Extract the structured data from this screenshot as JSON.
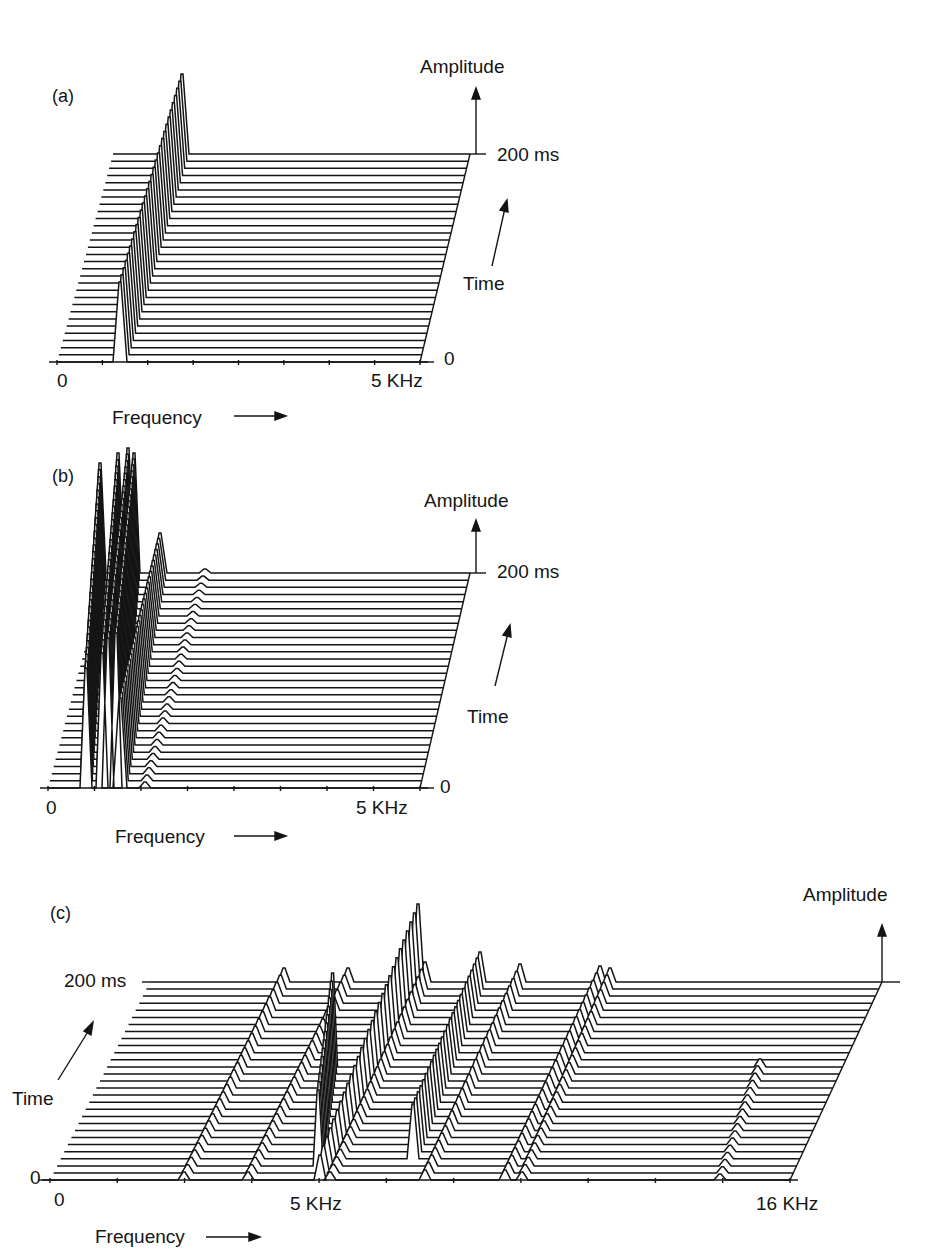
{
  "figure": {
    "background": "#ffffff",
    "ink": "#141414"
  },
  "chart_data": [
    {
      "panel": "(a)",
      "type": "waterfall",
      "title": "",
      "xlabel": "Frequency",
      "ylabel": "Amplitude",
      "zlabel": "Time",
      "x_ticks": [
        "0",
        "5 KHz"
      ],
      "xlim_khz": [
        0,
        5
      ],
      "time_ticks": [
        "0",
        "200 ms"
      ],
      "num_slices": 30,
      "description": "Single steady spectral peak (pure tone) at ~0.7 kHz with constant amplitude across all time slices",
      "peaks": [
        {
          "freq_khz": 0.75,
          "amplitude": 1.0,
          "time_start": 0,
          "time_end": 1
        }
      ]
    },
    {
      "panel": "(b)",
      "type": "waterfall",
      "xlabel": "Frequency",
      "ylabel": "Amplitude",
      "zlabel": "Time",
      "x_ticks": [
        "0",
        "5 KHz"
      ],
      "xlim_khz": [
        0,
        5
      ],
      "time_ticks": [
        "0",
        "200 ms"
      ],
      "num_slices": 31,
      "description": "Low-frequency energy concentrated below ~1 kHz with strong harmonics; small minor peaks up to ~2 kHz",
      "peaks": [
        {
          "freq_khz": 0.35,
          "amplitude": 0.75
        },
        {
          "freq_khz": 0.5,
          "amplitude": 0.9
        },
        {
          "freq_khz": 0.65,
          "amplitude": 1.0
        },
        {
          "freq_khz": 0.8,
          "amplitude": 0.85
        },
        {
          "freq_khz": 1.35,
          "amplitude": 0.3
        },
        {
          "freq_khz": 2.0,
          "amplitude": 0.05
        }
      ]
    },
    {
      "panel": "(c)",
      "type": "waterfall",
      "xlabel": "Frequency",
      "ylabel": "Amplitude",
      "zlabel": "Time",
      "x_ticks": [
        "0",
        "5 KHz",
        "16 KHz"
      ],
      "xlim_khz": [
        0,
        16
      ],
      "time_ticks": [
        "0",
        "200 ms"
      ],
      "num_slices": 29,
      "description": "Wideband spectrum with multiple harmonic ridges drifting upward in frequency over time; dominant peak near 5-6 kHz",
      "peaks": [
        {
          "freq_khz": 2.6,
          "amplitude": 0.1
        },
        {
          "freq_khz": 3.7,
          "amplitude": 0.1
        },
        {
          "freq_khz": 5.0,
          "amplitude": 0.7
        },
        {
          "freq_khz": 5.9,
          "amplitude": 1.0
        },
        {
          "freq_khz": 7.3,
          "amplitude": 0.5
        },
        {
          "freq_khz": 8.2,
          "amplitude": 0.25
        },
        {
          "freq_khz": 9.3,
          "amplitude": 0.15
        },
        {
          "freq_khz": 14.6,
          "amplitude": 0.1
        }
      ]
    }
  ],
  "panels": {
    "a": {
      "label": "(a)",
      "amplitude": "Amplitude",
      "time_top": "200 ms",
      "time_zero": "0",
      "time": "Time",
      "x0": "0",
      "x1": "5 KHz",
      "freq": "Frequency"
    },
    "b": {
      "label": "(b)",
      "amplitude": "Amplitude",
      "time_top": "200 ms",
      "time_zero": "0",
      "time": "Time",
      "x0": "0",
      "x1": "5 KHz",
      "freq": "Frequency"
    },
    "c": {
      "label": "(c)",
      "amplitude": "Amplitude",
      "time_top": "200 ms",
      "time_zero": "0",
      "time": "Time",
      "x0": "0",
      "x_mid": "5 KHz",
      "x1": "16 KHz",
      "freq": "Frequency"
    }
  },
  "render": {
    "a": {
      "base": {
        "y0": 362,
        "x0": 57,
        "x1": 420
      },
      "top": {
        "y": 154,
        "x0": 113,
        "x1": 470
      },
      "n": 30,
      "ticks": 8,
      "ridges": [
        {
          "x0": 120,
          "x1": 182,
          "h0": 80,
          "h1": 80,
          "w": 7,
          "fill": true
        }
      ]
    },
    "b": {
      "base": {
        "y0": 788,
        "x0": 48,
        "x1": 420
      },
      "top": {
        "y": 573,
        "x0": 105,
        "x1": 470
      },
      "n": 31,
      "ticks": 8,
      "ridges": [
        {
          "x0": 86,
          "x1": 100,
          "h0": 120,
          "h1": 110,
          "w": 6,
          "fill": true
        },
        {
          "x0": 102,
          "x1": 118,
          "h0": 135,
          "h1": 120,
          "w": 6,
          "fill": true
        },
        {
          "x0": 108,
          "x1": 128,
          "h0": 150,
          "h1": 125,
          "w": 6,
          "fill": true
        },
        {
          "x0": 116,
          "x1": 134,
          "h0": 155,
          "h1": 120,
          "w": 6,
          "fill": true
        },
        {
          "x0": 120,
          "x1": 160,
          "h0": 90,
          "h1": 40,
          "w": 7,
          "fill": false
        },
        {
          "x0": 145,
          "x1": 205,
          "h0": 6,
          "h1": 4,
          "w": 6,
          "fill": false
        }
      ]
    },
    "c": {
      "base": {
        "y0": 1180,
        "x0": 50,
        "x1": 790
      },
      "top": {
        "y": 982,
        "x0": 150,
        "x1": 882
      },
      "n": 29,
      "ticks": 11,
      "ridges": [
        {
          "x0": 184,
          "x1": 284,
          "h0": 8,
          "h1": 14,
          "w": 6,
          "fill": false
        },
        {
          "x0": 248,
          "x1": 348,
          "h0": 8,
          "h1": 14,
          "w": 6,
          "fill": false
        },
        {
          "x0": 316,
          "x1": 345,
          "h0": 75,
          "h1": 95,
          "w": 5,
          "fill": true,
          "t0": 0.05,
          "t1": 0.6
        },
        {
          "x0": 320,
          "x1": 418,
          "h0": 25,
          "h1": 78,
          "w": 6,
          "fill": true
        },
        {
          "x0": 330,
          "x1": 425,
          "h0": 8,
          "h1": 20,
          "w": 6,
          "fill": false
        },
        {
          "x0": 405,
          "x1": 480,
          "h0": 55,
          "h1": 30,
          "w": 6,
          "fill": true,
          "t0": 0.1,
          "t1": 1
        },
        {
          "x0": 425,
          "x1": 520,
          "h0": 10,
          "h1": 18,
          "w": 6,
          "fill": false
        },
        {
          "x0": 505,
          "x1": 600,
          "h0": 10,
          "h1": 16,
          "w": 6,
          "fill": false
        },
        {
          "x0": 522,
          "x1": 610,
          "h0": 8,
          "h1": 14,
          "w": 6,
          "fill": false
        },
        {
          "x0": 720,
          "x1": 790,
          "h0": 6,
          "h1": 8,
          "w": 6,
          "fill": false,
          "t0": 0,
          "t1": 0.6
        }
      ]
    }
  }
}
